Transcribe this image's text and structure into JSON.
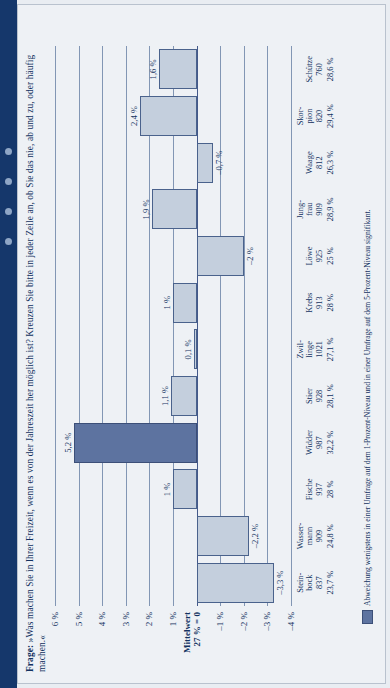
{
  "header": {
    "question_label": "Frage:",
    "question_text": "»Was machen Sie in Ihrer Freizeit, wenn es von der Jahreszeit her möglich ist? Kreuzen Sie bitte in jeder Zeile an, ob Sie das nie, ab und zu, oder häufig machen.«"
  },
  "footnote": {
    "text": "Abweichung wenigstens in einer Umfrage auf dem 1-Prozent-Niveau und in einer Umfrage auf dem 5-Prozent-Niveau signifikant."
  },
  "colors": {
    "sidebar": "#15376b",
    "panel_bg": "#eef1f5",
    "bar_normal": "#c4cfdd",
    "bar_significant": "#5d73a0",
    "ink": "#13315f",
    "gridline": "#8296b4"
  },
  "chart_data": {
    "type": "bar",
    "title": "",
    "xlabel": "",
    "ylabel": "",
    "ylim": [
      -4,
      6
    ],
    "grid": true,
    "baseline_label_line1": "Mittelwert",
    "baseline_label_line2": "27 % = 0",
    "ytick_labels": [
      "6 %",
      "5 %",
      "4 %",
      "3 %",
      "2 %",
      "1 %",
      "",
      "–1 %",
      "–2 %",
      "–3 %",
      "–4 %"
    ],
    "ytick_values": [
      6,
      5,
      4,
      3,
      2,
      1,
      0,
      -1,
      -2,
      -3,
      -4
    ],
    "categories": [
      "Stein-\nbock",
      "Wasser-\nmann",
      "Fische",
      "Widder",
      "Stier",
      "Zwil-\nlinge",
      "Krebs",
      "Löwe",
      "Jung-\nfrau",
      "Waage",
      "Skor-\npion",
      "Schütze"
    ],
    "counts": [
      837,
      909,
      937,
      987,
      928,
      1021,
      913,
      925,
      909,
      812,
      820,
      760
    ],
    "shares": [
      "23,7 %",
      "24,8 %",
      "28 %",
      "32,2 %",
      "28,1 %",
      "27,1 %",
      "28 %",
      "25 %",
      "28,9 %",
      "26,3 %",
      "29,4 %",
      "28,6 %"
    ],
    "values": [
      -3.3,
      -2.2,
      1.0,
      5.2,
      1.1,
      0.1,
      1.0,
      -2.0,
      1.9,
      -0.7,
      2.4,
      1.6
    ],
    "value_labels": [
      "–3,3 %",
      "–2,2 %",
      "1 %",
      "5,2 %",
      "1,1 %",
      "0,1 %",
      "1 %",
      "–2 %",
      "1,9 %",
      "–0,7 %",
      "2,4 %",
      "1,6 %"
    ],
    "significant": [
      false,
      false,
      false,
      true,
      false,
      false,
      false,
      false,
      false,
      false,
      false,
      false
    ],
    "legend": [
      {
        "swatch": "#5d73a0",
        "label": "Abweichung wenigstens in einer Umfrage auf dem 1-Prozent-Niveau und in einer Umfrage auf dem 5-Prozent-Niveau signifikant."
      }
    ]
  }
}
